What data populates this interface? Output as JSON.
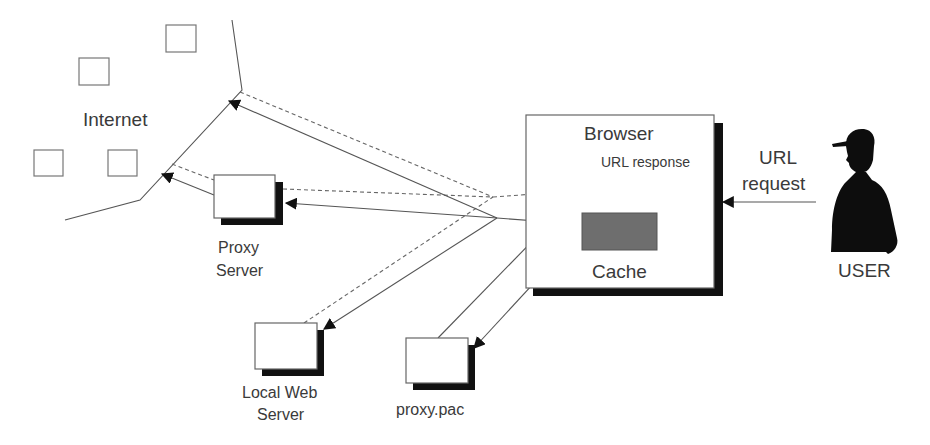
{
  "diagram": {
    "type": "network-flow",
    "nodes": {
      "internet": {
        "label": "Internet"
      },
      "proxy_server": {
        "label_line1": "Proxy",
        "label_line2": "Server"
      },
      "local_web_server": {
        "label_line1": "Local Web",
        "label_line2": "Server"
      },
      "proxy_pac": {
        "label": "proxy.pac"
      },
      "browser": {
        "label": "Browser"
      },
      "cache": {
        "label": "Cache"
      },
      "user": {
        "label": "USER"
      }
    },
    "edge_labels": {
      "url_response": "URL response",
      "url_request_line1": "URL",
      "url_request_line2": "request"
    },
    "edges": [
      {
        "from": "user",
        "to": "browser",
        "style": "solid",
        "label": "URL request"
      },
      {
        "from": "browser",
        "to": "cache",
        "style": "solid"
      },
      {
        "from": "cache",
        "to": "proxy_pac",
        "style": "solid"
      },
      {
        "from": "proxy_pac",
        "to": "browser",
        "style": "solid"
      },
      {
        "from": "browser",
        "to": "internet",
        "style": "solid"
      },
      {
        "from": "browser",
        "to": "proxy_server",
        "style": "solid"
      },
      {
        "from": "browser",
        "to": "local_web_server",
        "style": "solid"
      },
      {
        "from": "proxy_server",
        "to": "internet",
        "style": "solid"
      },
      {
        "from": "internet",
        "to": "browser",
        "style": "dashed",
        "label": "URL response"
      },
      {
        "from": "proxy_server",
        "to": "browser",
        "style": "dashed"
      },
      {
        "from": "local_web_server",
        "to": "browser",
        "style": "dashed"
      }
    ],
    "colors": {
      "line": "#555555",
      "shadow": "#111111",
      "cache_fill": "#6e6e6e",
      "user_silhouette": "#0d0d0d",
      "text": "#3a3a3a"
    }
  }
}
